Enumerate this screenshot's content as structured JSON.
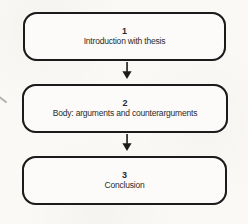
{
  "page": {
    "background_color": "#faf9f6",
    "line_color": "#1b1b1b",
    "text_color": "#2b2b2b"
  },
  "flowchart": {
    "type": "vertical-flow",
    "steps": [
      {
        "number": "1",
        "label": "Introduction with thesis"
      },
      {
        "number": "2",
        "label": "Body: arguments and counterarguments"
      },
      {
        "number": "3",
        "label": "Conclusion"
      }
    ],
    "connector": "down-arrow"
  }
}
